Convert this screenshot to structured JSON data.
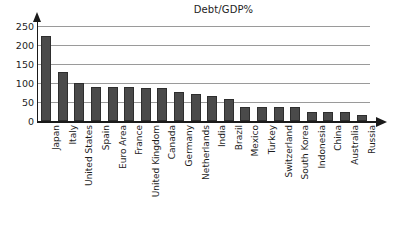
{
  "chart_data": {
    "type": "bar",
    "title": "Debt/GDP%",
    "xlabel": "",
    "ylabel": "",
    "ylim": [
      0,
      250
    ],
    "yticks": [
      0,
      50,
      100,
      150,
      200,
      250
    ],
    "grid": true,
    "legend": false,
    "categories": [
      "Japan",
      "Italy",
      "United States",
      "Spain",
      "Euro Area",
      "France",
      "United Kingdom",
      "Canada",
      "Germany",
      "Netherlands",
      "India",
      "Brazil",
      "Mexico",
      "Turkey",
      "Switzerland",
      "South Korea",
      "Indonesia",
      "China",
      "Australia",
      "Russia"
    ],
    "values": [
      224,
      129,
      100,
      89,
      89,
      90,
      88,
      88,
      77,
      71,
      67,
      57,
      38,
      36,
      37,
      37,
      25,
      23,
      23,
      17
    ],
    "bar_color": "#4a4a4a",
    "bar_edge_color": "#2e2e2e",
    "grid_color": "#9a9a9a",
    "axis_color": "#1a1a1a"
  }
}
